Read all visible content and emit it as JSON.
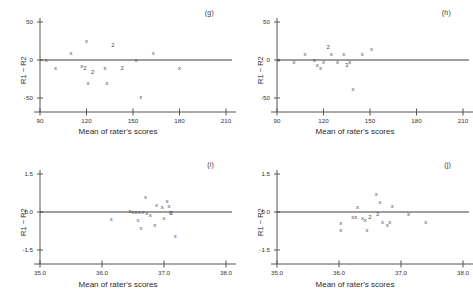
{
  "figure": {
    "axis_x_label": "Mean of rater's scores",
    "axis_y_label": "R1 − R2",
    "line_color": "#555555",
    "marker_color": "#4a4a4a",
    "marker_glyph": "x",
    "duplicate_glyph": "2",
    "triple_glyph": "3"
  },
  "panels": [
    {
      "tag": "(g)",
      "xlim": [
        90,
        210
      ],
      "ylim": [
        -50,
        50
      ],
      "xticks": [
        "90",
        "120",
        "150",
        "180",
        "210"
      ],
      "xtick_values": [
        90,
        120,
        150,
        180,
        210
      ],
      "yticks": [
        "50",
        "0",
        "-50"
      ],
      "ytick_values": [
        50,
        0,
        -50
      ],
      "reference_line_y": 0
    },
    {
      "tag": "(h)",
      "xlim": [
        90,
        210
      ],
      "ylim": [
        -50,
        50
      ],
      "xticks": [
        "90",
        "120",
        "150",
        "180",
        "210"
      ],
      "xtick_values": [
        90,
        120,
        150,
        180,
        210
      ],
      "yticks": [
        "50",
        "0",
        "-50"
      ],
      "ytick_values": [
        50,
        0,
        -50
      ],
      "reference_line_y": 0
    },
    {
      "tag": "(i)",
      "xlim": [
        35.0,
        38.0
      ],
      "ylim": [
        -1.5,
        1.5
      ],
      "xticks": [
        "35.0",
        "36.0",
        "37.0",
        "38.0"
      ],
      "xtick_values": [
        35.0,
        36.0,
        37.0,
        38.0
      ],
      "yticks": [
        "1.5",
        "0.0",
        "-1.5"
      ],
      "ytick_values": [
        1.5,
        0.0,
        -1.5
      ],
      "reference_line_y": 0
    },
    {
      "tag": "(j)",
      "xlim": [
        35.0,
        38.0
      ],
      "ylim": [
        -1.5,
        1.5
      ],
      "xticks": [
        "35.0",
        "36.0",
        "37.0",
        "38.0"
      ],
      "xtick_values": [
        35.0,
        36.0,
        37.0,
        38.0
      ],
      "yticks": [
        "1.5",
        "0.0",
        "-1.5"
      ],
      "ytick_values": [
        1.5,
        0.0,
        -1.5
      ],
      "reference_line_y": 0
    }
  ],
  "chart_data": [
    {
      "type": "scatter",
      "title": "(g)",
      "xlabel": "Mean of rater's scores",
      "ylabel": "R1 − R2",
      "xlim": [
        90,
        210
      ],
      "ylim": [
        -50,
        50
      ],
      "grid": false,
      "legend": null,
      "reference_line": 0,
      "points": [
        {
          "x": 94,
          "y": 0,
          "label": "x"
        },
        {
          "x": 100,
          "y": -10,
          "label": "x"
        },
        {
          "x": 110,
          "y": 9,
          "label": "x"
        },
        {
          "x": 117,
          "y": -8,
          "label": "x"
        },
        {
          "x": 119,
          "y": -10,
          "label": "2"
        },
        {
          "x": 120,
          "y": 25,
          "label": "x"
        },
        {
          "x": 121,
          "y": -30,
          "label": "x"
        },
        {
          "x": 124,
          "y": -16,
          "label": "2"
        },
        {
          "x": 132,
          "y": -10,
          "label": "x"
        },
        {
          "x": 133,
          "y": -30,
          "label": "x"
        },
        {
          "x": 137,
          "y": 20,
          "label": "2"
        },
        {
          "x": 143,
          "y": -10,
          "label": "2"
        },
        {
          "x": 152,
          "y": 0,
          "label": "x"
        },
        {
          "x": 155,
          "y": -48,
          "label": "x"
        },
        {
          "x": 163,
          "y": 9,
          "label": "x"
        },
        {
          "x": 180,
          "y": -10,
          "label": "x"
        }
      ]
    },
    {
      "type": "scatter",
      "title": "(h)",
      "xlabel": "Mean of rater's scores",
      "ylabel": "R1 − R2",
      "xlim": [
        90,
        210
      ],
      "ylim": [
        -50,
        50
      ],
      "grid": false,
      "legend": null,
      "reference_line": 0,
      "points": [
        {
          "x": 91,
          "y": 0,
          "label": "x"
        },
        {
          "x": 101,
          "y": -2,
          "label": "x"
        },
        {
          "x": 108,
          "y": 8,
          "label": "x"
        },
        {
          "x": 114,
          "y": 0,
          "label": "x"
        },
        {
          "x": 116,
          "y": -6,
          "label": "x"
        },
        {
          "x": 118,
          "y": -10,
          "label": "x"
        },
        {
          "x": 120,
          "y": -2,
          "label": "x"
        },
        {
          "x": 123,
          "y": 17,
          "label": "2"
        },
        {
          "x": 125,
          "y": 8,
          "label": "x"
        },
        {
          "x": 129,
          "y": -2,
          "label": "x"
        },
        {
          "x": 133,
          "y": 8,
          "label": "x"
        },
        {
          "x": 135,
          "y": -7,
          "label": "3"
        },
        {
          "x": 137,
          "y": -2,
          "label": "x"
        },
        {
          "x": 139,
          "y": -38,
          "label": "x"
        },
        {
          "x": 145,
          "y": 8,
          "label": "x"
        },
        {
          "x": 151,
          "y": 14,
          "label": "x"
        }
      ]
    },
    {
      "type": "scatter",
      "title": "(i)",
      "xlabel": "Mean of rater's scores",
      "ylabel": "R1 − R2",
      "xlim": [
        35.0,
        38.0
      ],
      "ylim": [
        -1.5,
        1.5
      ],
      "grid": false,
      "legend": null,
      "reference_line": 0,
      "points": [
        {
          "x": 36.15,
          "y": -0.28,
          "label": "x"
        },
        {
          "x": 36.45,
          "y": 0.05,
          "label": "x"
        },
        {
          "x": 36.5,
          "y": 0.02,
          "label": "x"
        },
        {
          "x": 36.55,
          "y": 0.0,
          "label": "x"
        },
        {
          "x": 36.58,
          "y": -0.3,
          "label": "x"
        },
        {
          "x": 36.6,
          "y": 0.0,
          "label": "x"
        },
        {
          "x": 36.63,
          "y": -0.62,
          "label": "x"
        },
        {
          "x": 36.66,
          "y": 0.0,
          "label": "x"
        },
        {
          "x": 36.7,
          "y": 0.58,
          "label": "x"
        },
        {
          "x": 36.72,
          "y": -0.05,
          "label": "x"
        },
        {
          "x": 36.78,
          "y": -0.1,
          "label": "x"
        },
        {
          "x": 36.85,
          "y": -0.52,
          "label": "x"
        },
        {
          "x": 36.88,
          "y": 0.3,
          "label": "x"
        },
        {
          "x": 36.97,
          "y": 0.22,
          "label": "x"
        },
        {
          "x": 37.0,
          "y": -0.22,
          "label": "x"
        },
        {
          "x": 37.05,
          "y": 0.42,
          "label": "x"
        },
        {
          "x": 37.08,
          "y": 0.26,
          "label": "x"
        },
        {
          "x": 37.1,
          "y": 0.02,
          "label": "x"
        },
        {
          "x": 37.12,
          "y": -0.02,
          "label": "2"
        },
        {
          "x": 37.18,
          "y": -0.95,
          "label": "x"
        }
      ]
    },
    {
      "type": "scatter",
      "title": "(j)",
      "xlabel": "Mean of rater's scores",
      "ylabel": "R1 − R2",
      "xlim": [
        35.0,
        38.0
      ],
      "ylim": [
        -1.5,
        1.5
      ],
      "grid": false,
      "legend": null,
      "reference_line": 0,
      "points": [
        {
          "x": 36.03,
          "y": -0.42,
          "label": "x"
        },
        {
          "x": 36.03,
          "y": -0.7,
          "label": "x"
        },
        {
          "x": 36.22,
          "y": -0.18,
          "label": "x"
        },
        {
          "x": 36.27,
          "y": -0.2,
          "label": "x"
        },
        {
          "x": 36.3,
          "y": 0.22,
          "label": "x"
        },
        {
          "x": 36.38,
          "y": -0.25,
          "label": "x"
        },
        {
          "x": 36.42,
          "y": -0.3,
          "label": "x"
        },
        {
          "x": 36.45,
          "y": -0.7,
          "label": "x"
        },
        {
          "x": 36.5,
          "y": -0.2,
          "label": "2"
        },
        {
          "x": 36.6,
          "y": 0.7,
          "label": "x"
        },
        {
          "x": 36.62,
          "y": -0.08,
          "label": "3"
        },
        {
          "x": 36.66,
          "y": 0.4,
          "label": "x"
        },
        {
          "x": 36.7,
          "y": -0.4,
          "label": "x"
        },
        {
          "x": 36.78,
          "y": -0.52,
          "label": "x"
        },
        {
          "x": 36.82,
          "y": -0.4,
          "label": "x"
        },
        {
          "x": 36.86,
          "y": 0.25,
          "label": "x"
        },
        {
          "x": 37.12,
          "y": -0.08,
          "label": "x"
        },
        {
          "x": 37.4,
          "y": -0.4,
          "label": "x"
        }
      ]
    }
  ]
}
